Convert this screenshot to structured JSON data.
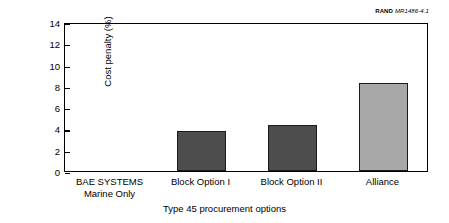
{
  "credit": {
    "brand": "RAND",
    "id": "MR1486-4.1"
  },
  "chart_data": {
    "type": "bar",
    "title": "",
    "xlabel": "Type 45 procurement options",
    "ylabel": "Cost penalty (%)",
    "categories": [
      "BAE SYSTEMS\nMarine Only",
      "Block Option I",
      "Block Option II",
      "Alliance"
    ],
    "values": [
      0,
      3.75,
      4.3,
      8.3
    ],
    "bar_colors": [
      "#4d4d4d",
      "#4d4d4d",
      "#4d4d4d",
      "#a8a8a8"
    ],
    "ylim": [
      0,
      14
    ],
    "yticks": [
      0,
      2,
      4,
      6,
      8,
      10,
      12,
      14
    ],
    "ytick_labels": [
      "0",
      "2",
      "4",
      "6",
      "8",
      "10",
      "12",
      "14"
    ],
    "grid": false,
    "legend": "none",
    "frame": "box",
    "frame_color": "#000000"
  }
}
